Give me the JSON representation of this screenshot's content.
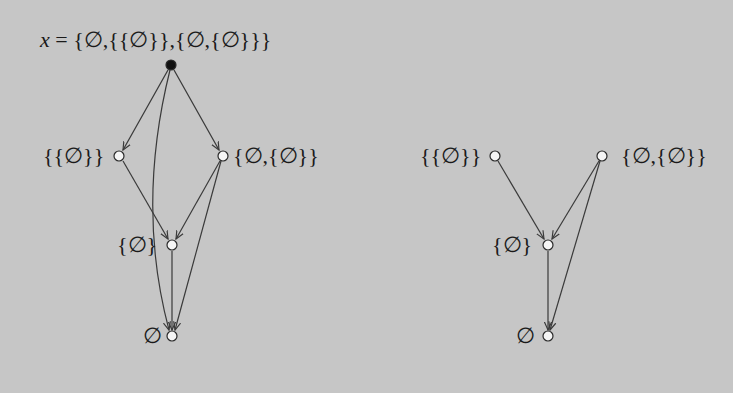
{
  "colors": {
    "background": "#c6c6c6",
    "edge": "#3a3a3a",
    "node_fill_open": "#f5f5f5",
    "node_fill_root": "#111111",
    "node_stroke": "#2a2a2a",
    "text": "#1a1a1a"
  },
  "left_graph": {
    "title": {
      "var": "x",
      "eq": " = ",
      "value": "{∅,{{∅}},{∅,{∅}}}"
    },
    "nodes": [
      {
        "id": "x",
        "label": "",
        "x": 171,
        "y": 65,
        "filled": true
      },
      {
        "id": "a",
        "label": "{{∅}}",
        "x": 119,
        "y": 156,
        "filled": false
      },
      {
        "id": "b",
        "label": "{∅,{∅}}",
        "x": 223,
        "y": 156,
        "filled": false
      },
      {
        "id": "c",
        "label": "{∅}",
        "x": 172,
        "y": 245,
        "filled": false
      },
      {
        "id": "d",
        "label": "∅",
        "x": 172,
        "y": 336,
        "filled": false
      }
    ],
    "edges": [
      {
        "from": "x",
        "to": "a"
      },
      {
        "from": "x",
        "to": "b"
      },
      {
        "from": "x",
        "to": "d",
        "curved": true
      },
      {
        "from": "a",
        "to": "c"
      },
      {
        "from": "b",
        "to": "c"
      },
      {
        "from": "b",
        "to": "d"
      },
      {
        "from": "c",
        "to": "d"
      }
    ]
  },
  "right_graph": {
    "nodes": [
      {
        "id": "a",
        "label": "{{∅}}",
        "x": 495,
        "y": 156,
        "filled": false
      },
      {
        "id": "b",
        "label": "{∅,{∅}}",
        "x": 602,
        "y": 156,
        "filled": false
      },
      {
        "id": "c",
        "label": "{∅}",
        "x": 548,
        "y": 245,
        "filled": false
      },
      {
        "id": "d",
        "label": "∅",
        "x": 548,
        "y": 336,
        "filled": false
      }
    ],
    "edges": [
      {
        "from": "a",
        "to": "c"
      },
      {
        "from": "b",
        "to": "c"
      },
      {
        "from": "b",
        "to": "d"
      },
      {
        "from": "c",
        "to": "d"
      }
    ]
  }
}
